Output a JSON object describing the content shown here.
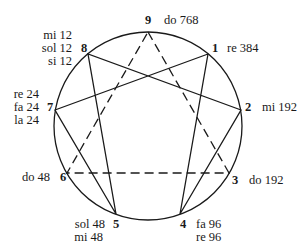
{
  "diagram": {
    "type": "enneagram",
    "circle": {
      "cx": 148,
      "cy": 126,
      "r": 94
    },
    "points": [
      {
        "id": "9",
        "notes": [
          "do 768"
        ]
      },
      {
        "id": "1",
        "notes": [
          "re 384"
        ]
      },
      {
        "id": "2",
        "notes": [
          "mi 192"
        ]
      },
      {
        "id": "3",
        "notes": [
          "do 192"
        ]
      },
      {
        "id": "4",
        "notes": [
          "fa 96",
          "re 96"
        ]
      },
      {
        "id": "5",
        "notes": [
          "sol 48",
          "mi 48"
        ]
      },
      {
        "id": "6",
        "notes": [
          "do 48"
        ]
      },
      {
        "id": "7",
        "notes": [
          "re 24",
          "fa 24",
          "la 24"
        ]
      },
      {
        "id": "8",
        "notes": [
          "mi 12",
          "sol 12",
          "si 12"
        ]
      }
    ],
    "solid_path": [
      "1",
      "4",
      "2",
      "8",
      "5",
      "7",
      "1"
    ],
    "dashed_triangle": [
      "9",
      "3",
      "6",
      "9"
    ]
  },
  "labels": {
    "p9": "9",
    "p1": "1",
    "p2": "2",
    "p3": "3",
    "p4": "4",
    "p5": "5",
    "p6": "6",
    "p7": "7",
    "p8": "8",
    "n9": "do 768",
    "n1": "re 384",
    "n2": "mi 192",
    "n3": "do 192",
    "n4a": "fa 96",
    "n4b": "re 96",
    "n5a": "sol 48",
    "n5b": "mi 48",
    "n6": "do 48",
    "n7a": "re 24",
    "n7b": "fa 24",
    "n7c": "la 24",
    "n8a": "mi 12",
    "n8b": "sol 12",
    "n8c": "si 12"
  }
}
